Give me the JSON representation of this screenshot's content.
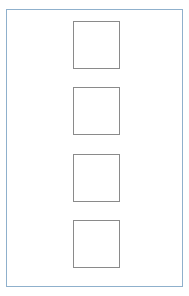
{
  "diagram": {
    "frame": {
      "border_color": "#8fb0cc"
    },
    "cells": [
      {
        "index": 1,
        "label": "",
        "top": 21
      },
      {
        "index": 2,
        "label": "",
        "top": 87
      },
      {
        "index": 3,
        "label": "",
        "top": 154
      },
      {
        "index": 4,
        "label": "",
        "top": 220
      }
    ],
    "cell_border_color": "#8a8a8a",
    "cell_count": 4
  }
}
